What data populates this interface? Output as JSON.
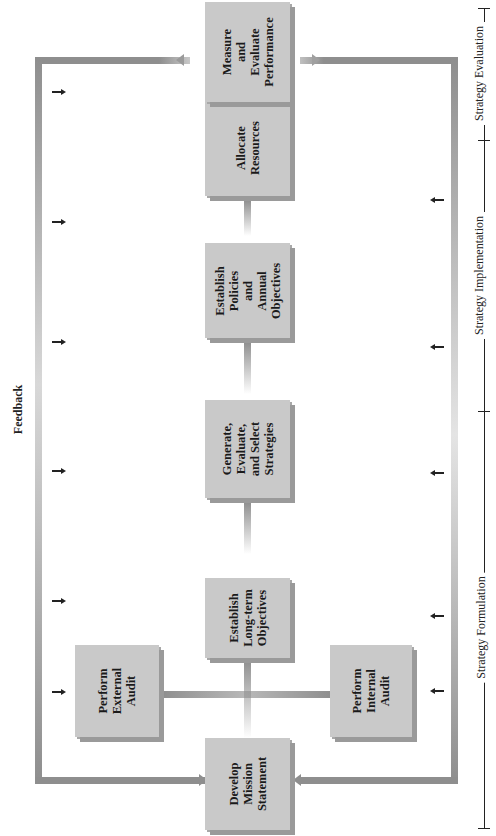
{
  "diagram": {
    "feedback_label": "Feedback",
    "boxes": {
      "mission": "Develop\nMission\nStatement",
      "external_audit": "Perform\nExternal\nAudit",
      "internal_audit": "Perform\nInternal\nAudit",
      "long_term": "Establish\nLong-term\nObjectives",
      "generate": "Generate,\nEvaluate,\nand Select\nStrategies",
      "policies": "Establish\nPolicies\nand\nAnnual\nObjectives",
      "allocate": "Allocate\nResources",
      "measure": "Measure\nand\nEvaluate\nPerformance"
    },
    "phases": {
      "formulation": "Strategy Formulation",
      "implementation": "Strategy Implementation",
      "evaluation": "Strategy Evaluation"
    },
    "colors": {
      "box_fill": "#c9c9c9",
      "box_shadow": "#9a9a9a",
      "arrow": "#8e8e8e",
      "text": "#1a1a1a"
    }
  }
}
